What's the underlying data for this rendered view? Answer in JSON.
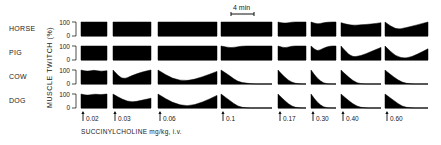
{
  "chart_data": {
    "type": "area",
    "title": "",
    "ylabel": "MUSCLE TWITCH (%)",
    "xlabel": "SUCCINYLCHOLINE mg/kg, i.v.",
    "y_ticks": [
      "100",
      "0"
    ],
    "ylim": [
      0,
      100
    ],
    "scale_bar": "4 min",
    "species": [
      "HORSE",
      "PIG",
      "COW",
      "DOG"
    ],
    "doses": [
      "0.02",
      "0.03",
      "0.06",
      "0.1",
      "0.17",
      "0.30",
      "0.40",
      "0.60"
    ],
    "series": [
      {
        "name": "HORSE",
        "traces": [
          [
            100,
            100,
            100,
            100,
            100
          ],
          [
            100,
            100,
            100,
            100,
            100
          ],
          [
            100,
            100,
            100,
            100,
            100,
            100
          ],
          [
            100,
            100,
            100,
            100,
            100,
            100
          ],
          [
            100,
            90,
            100,
            100,
            100
          ],
          [
            100,
            85,
            95,
            100,
            100
          ],
          [
            95,
            75,
            80,
            85,
            95
          ],
          [
            100,
            45,
            60,
            80,
            100
          ]
        ]
      },
      {
        "name": "PIG",
        "traces": [
          [
            100,
            100,
            100,
            100,
            100
          ],
          [
            100,
            100,
            100,
            100,
            100
          ],
          [
            100,
            100,
            100,
            100,
            100,
            100
          ],
          [
            100,
            85,
            100,
            100,
            100,
            100
          ],
          [
            100,
            85,
            100,
            100,
            100
          ],
          [
            100,
            60,
            85,
            100,
            100
          ],
          [
            100,
            20,
            30,
            60,
            90
          ],
          [
            100,
            25,
            10,
            40,
            80
          ]
        ]
      },
      {
        "name": "COW",
        "traces": [
          [
            100,
            90,
            100,
            90,
            95
          ],
          [
            100,
            30,
            60,
            85,
            100
          ],
          [
            100,
            35,
            20,
            50,
            90
          ],
          [
            100,
            60,
            15,
            5,
            0,
            0,
            0
          ],
          [
            100,
            45,
            10,
            0,
            0
          ],
          [
            100,
            40,
            5,
            0,
            0
          ],
          [
            100,
            45,
            5,
            0,
            0,
            0
          ],
          [
            100,
            50,
            10,
            0,
            0,
            0
          ]
        ]
      },
      {
        "name": "DOG",
        "traces": [
          [
            100,
            90,
            100,
            95,
            100
          ],
          [
            100,
            60,
            40,
            55,
            70
          ],
          [
            100,
            35,
            10,
            40,
            90
          ],
          [
            100,
            55,
            10,
            0,
            0,
            0,
            0
          ],
          [
            100,
            50,
            10,
            0,
            0
          ],
          [
            100,
            40,
            5,
            0,
            0
          ],
          [
            100,
            50,
            10,
            0,
            0,
            0
          ],
          [
            100,
            55,
            10,
            0,
            0,
            0
          ]
        ]
      }
    ],
    "grid": false,
    "legend": "none"
  },
  "labels": {
    "species": [
      "HORSE",
      "PIG",
      "COW",
      "DOG"
    ],
    "y_axis_title": "MUSCLE TWITCH (%)",
    "y_tick_top": "100",
    "y_tick_bottom": "0",
    "x_axis_title": "SUCCINYLCHOLINE  mg/kg,  i.v.",
    "scale_bar_label": "4 min",
    "dose_labels": [
      "0.02",
      "0.03",
      "0.06",
      "0.1",
      "0.17",
      "0.30",
      "0.40",
      "0.60"
    ]
  },
  "layout": {
    "panel_x": [
      [
        81,
        107
      ],
      [
        113,
        151
      ],
      [
        158,
        217
      ],
      [
        221,
        272
      ],
      [
        278,
        306
      ],
      [
        311,
        336
      ],
      [
        341,
        381
      ],
      [
        385,
        428
      ]
    ],
    "row_top": [
      22,
      46,
      70,
      94
    ],
    "row_height": 14,
    "ink_color": "#000000"
  }
}
